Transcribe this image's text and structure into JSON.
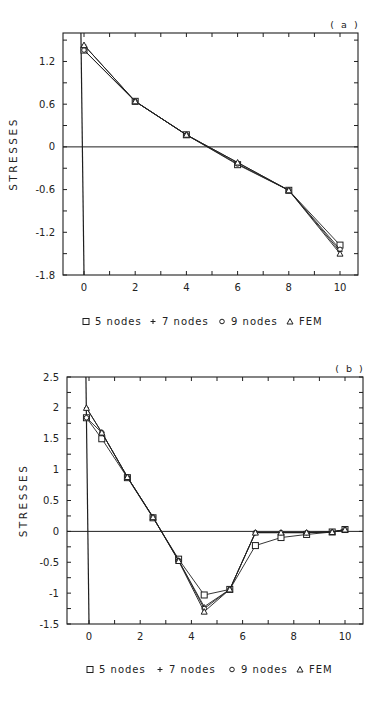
{
  "chart_data": [
    {
      "type": "line",
      "panel_label": "( a )",
      "title": "",
      "xlabel": "",
      "ylabel": "STRESSES",
      "xlim": [
        -0.8,
        10.7
      ],
      "ylim": [
        -1.8,
        1.6
      ],
      "x_ticks": [
        0,
        2,
        4,
        6,
        8,
        10
      ],
      "y_ticks": [
        1.2,
        0.6,
        0,
        -0.6,
        -1.2,
        -1.8
      ],
      "y_tick_labels": [
        "1.2",
        "0.6",
        "0",
        "-0.6",
        "-1.2",
        "-1.8"
      ],
      "grid": false,
      "legend_position": "bottom",
      "series": [
        {
          "name": "5 nodes",
          "marker": "square",
          "x": [
            0,
            2,
            4,
            6,
            8,
            10
          ],
          "values": [
            1.36,
            0.64,
            0.17,
            -0.25,
            -0.61,
            -1.38
          ]
        },
        {
          "name": "7 nodes",
          "marker": "plus",
          "x": [
            0,
            2,
            4,
            6,
            8,
            10
          ],
          "values": [
            1.43,
            0.64,
            0.17,
            -0.22,
            -0.61,
            -1.47
          ]
        },
        {
          "name": "9 nodes",
          "marker": "circle",
          "x": [
            0,
            2,
            4,
            6,
            8,
            10
          ],
          "values": [
            1.36,
            0.64,
            0.17,
            -0.24,
            -0.61,
            -1.44
          ]
        },
        {
          "name": "FEM",
          "marker": "triangle",
          "x": [
            0,
            2,
            4,
            6,
            8,
            10
          ],
          "values": [
            1.43,
            0.64,
            0.17,
            -0.22,
            -0.61,
            -1.5
          ]
        }
      ]
    },
    {
      "type": "line",
      "panel_label": "( b )",
      "title": "",
      "xlabel": "",
      "ylabel": "STRESSES",
      "xlim": [
        -0.8,
        10.7
      ],
      "ylim": [
        -1.5,
        2.5
      ],
      "x_ticks": [
        0,
        2,
        4,
        6,
        8,
        10
      ],
      "y_ticks": [
        2.5,
        2,
        1.5,
        1,
        0.5,
        0,
        -0.5,
        -1,
        -1.5
      ],
      "y_tick_labels": [
        "2.5",
        "2",
        "1.5",
        "1",
        "0.5",
        "0",
        "-0.5",
        "-1",
        "-1.5"
      ],
      "grid": false,
      "legend_position": "bottom",
      "series": [
        {
          "name": "5 nodes",
          "marker": "square",
          "x": [
            -0.1,
            0.5,
            1.5,
            2.5,
            3.5,
            4.5,
            5.5,
            6.5,
            7.5,
            8.5,
            9.5,
            10
          ],
          "values": [
            1.84,
            1.5,
            0.87,
            0.22,
            -0.45,
            -1.03,
            -0.94,
            -0.23,
            -0.1,
            -0.05,
            -0.01,
            0.03
          ]
        },
        {
          "name": "7 nodes",
          "marker": "plus",
          "x": [
            -0.1,
            0.5,
            1.5,
            2.5,
            3.5,
            4.5,
            5.5,
            6.5,
            7.5,
            8.5,
            9.5,
            10
          ],
          "values": [
            2.0,
            1.6,
            0.88,
            0.23,
            -0.47,
            -1.22,
            -0.94,
            -0.02,
            -0.02,
            -0.02,
            -0.01,
            0.03
          ]
        },
        {
          "name": "9 nodes",
          "marker": "circle",
          "x": [
            -0.1,
            0.5,
            1.5,
            2.5,
            3.5,
            4.5,
            5.5,
            6.5,
            7.5,
            8.5,
            9.5,
            10
          ],
          "values": [
            1.84,
            1.6,
            0.88,
            0.23,
            -0.47,
            -1.25,
            -0.94,
            -0.02,
            -0.02,
            -0.02,
            -0.01,
            0.03
          ]
        },
        {
          "name": "FEM",
          "marker": "triangle",
          "x": [
            -0.1,
            0.5,
            1.5,
            2.5,
            3.5,
            4.5,
            5.5,
            6.5,
            7.5,
            8.5,
            9.5,
            10
          ],
          "values": [
            2.0,
            1.6,
            0.88,
            0.23,
            -0.48,
            -1.3,
            -0.94,
            -0.02,
            -0.02,
            -0.02,
            -0.01,
            0.03
          ]
        }
      ]
    }
  ],
  "legend": {
    "items": [
      {
        "symbol": "□",
        "label": "5 nodes"
      },
      {
        "symbol": "+",
        "label": "7 nodes"
      },
      {
        "symbol": "∘",
        "label": "9 nodes"
      },
      {
        "symbol": "▵",
        "label": "FEM"
      }
    ]
  },
  "layout": {
    "panels": [
      {
        "left": 63,
        "right": 358,
        "top": 33,
        "bottom": 275,
        "x0px": 84,
        "x10px": 340,
        "legend_y": 325,
        "tag_x": 345,
        "tag_y": 28
      },
      {
        "left": 67,
        "right": 363,
        "top": 377,
        "bottom": 624,
        "x0px": 89,
        "x10px": 345,
        "legend_y": 673,
        "tag_x": 350,
        "tag_y": 372
      }
    ],
    "colors": {
      "ink": "#1f1f1f",
      "background": "#ffffff"
    }
  }
}
